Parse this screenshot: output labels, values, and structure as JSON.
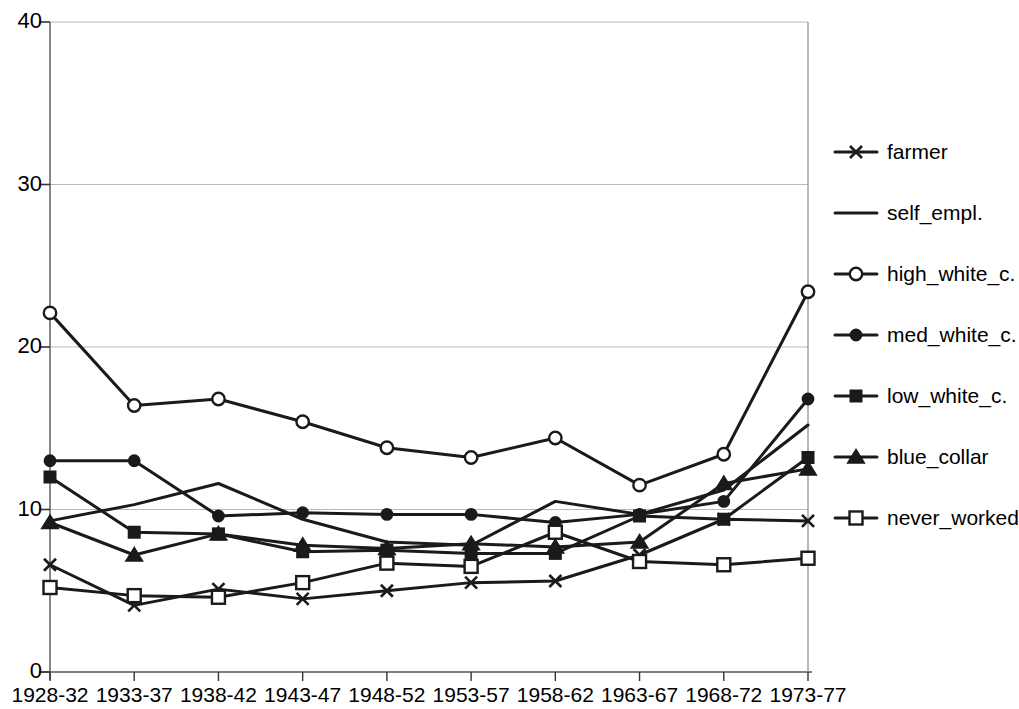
{
  "chart_data": {
    "type": "line",
    "title": "",
    "subtitle": "",
    "xlabel": "",
    "ylabel": "",
    "categories": [
      "1928-32",
      "1933-37",
      "1938-42",
      "1943-47",
      "1948-52",
      "1953-57",
      "1958-62",
      "1963-67",
      "1968-72",
      "1973-77"
    ],
    "ylim": [
      0,
      40
    ],
    "yticks": [
      0,
      10,
      20,
      30,
      40
    ],
    "ytick_labels": [
      "0",
      "10",
      "20",
      "30",
      "40"
    ],
    "grid": "horizontal",
    "legend_position": "right",
    "series": [
      {
        "name": "farmer",
        "marker": "x",
        "marker_style": "cross",
        "color": "#1a1a1a",
        "values": [
          6.6,
          4.1,
          5.1,
          4.5,
          5.0,
          5.5,
          5.6,
          7.2,
          9.4,
          9.3
        ]
      },
      {
        "name": "self_empl.",
        "marker": "none",
        "marker_style": "none",
        "color": "#1a1a1a",
        "values": [
          9.3,
          10.3,
          11.6,
          9.4,
          8.0,
          7.8,
          10.5,
          9.7,
          11.2,
          15.2
        ]
      },
      {
        "name": "high_white_c.",
        "marker": "o",
        "marker_style": "open-circle",
        "color": "#1a1a1a",
        "values": [
          22.1,
          16.4,
          16.8,
          15.4,
          13.8,
          13.2,
          14.4,
          11.5,
          13.4,
          23.4
        ]
      },
      {
        "name": "med_white_c.",
        "marker": "o",
        "marker_style": "filled-circle",
        "color": "#1a1a1a",
        "values": [
          13.0,
          13.0,
          9.6,
          9.8,
          9.7,
          9.7,
          9.2,
          9.7,
          10.5,
          16.8
        ]
      },
      {
        "name": "low_white_c.",
        "marker": "s",
        "marker_style": "filled-square",
        "color": "#1a1a1a",
        "values": [
          12.0,
          8.6,
          8.5,
          7.4,
          7.5,
          7.3,
          7.3,
          9.6,
          9.4,
          13.2
        ]
      },
      {
        "name": "blue_collar",
        "marker": "^",
        "marker_style": "filled-triangle",
        "color": "#1a1a1a",
        "values": [
          9.2,
          7.2,
          8.5,
          7.8,
          7.6,
          7.9,
          7.7,
          8.0,
          11.6,
          12.5
        ]
      },
      {
        "name": "never_worked",
        "marker": "s",
        "marker_style": "open-square",
        "color": "#1a1a1a",
        "values": [
          5.2,
          4.7,
          4.6,
          5.5,
          6.7,
          6.5,
          8.6,
          6.8,
          6.6,
          7.0
        ]
      }
    ]
  },
  "axes": {
    "y_axis_name": "y-axis",
    "x_axis_name": "x-axis"
  },
  "legend": {
    "items": [
      {
        "label": "farmer"
      },
      {
        "label": "self_empl."
      },
      {
        "label": "high_white_c."
      },
      {
        "label": "med_white_c."
      },
      {
        "label": "low_white_c."
      },
      {
        "label": "blue_collar"
      },
      {
        "label": "never_worked"
      }
    ]
  }
}
